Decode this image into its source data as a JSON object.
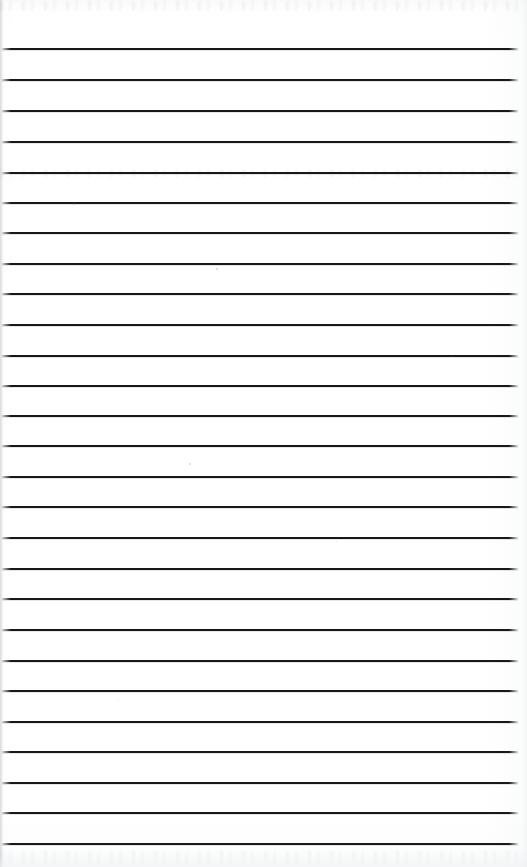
{
  "document": {
    "type": "scanned-lined-paper",
    "title": "Blank ruled page",
    "page_width": 527,
    "page_height": 867,
    "visible_text": "",
    "notes": "Scanned blank lined notebook / ledger sheet. No printed or handwritten text is legible; only horizontal ruled lines and faint scanner bleed-through artifacts are present."
  },
  "colors": {
    "paper": "#ffffff",
    "paper_tint": "#fbfbfc",
    "rule_line": "#17181b",
    "edge_shadow": "#e4e6e8",
    "ghost_artifact": "#282c34"
  },
  "ruling": {
    "line_count": 27,
    "line_thickness_px": 2,
    "first_line_y": 48,
    "last_line_y": 843,
    "average_spacing_px": 30.6,
    "left_margin_px": 2,
    "right_margin_px": 9,
    "line_left_x": 2,
    "line_width_px": 516,
    "lines_y": [
      48,
      79,
      110,
      141,
      172,
      202,
      232,
      263,
      293,
      324,
      355,
      385,
      415,
      445,
      476,
      506,
      537,
      568,
      598,
      629,
      660,
      690,
      721,
      751,
      782,
      812,
      843
    ]
  },
  "artifacts": {
    "ghost_bands": [
      {
        "name": "top-bleed-through",
        "y": 1,
        "height": 10
      },
      {
        "name": "mid-bleed-through",
        "y": 169,
        "height": 8
      },
      {
        "name": "footer-bleed-through",
        "y": 851,
        "height": 12
      }
    ],
    "specks": [
      {
        "x": 73,
        "y": 203,
        "size": 2
      },
      {
        "x": 216,
        "y": 268,
        "size": 2
      },
      {
        "x": 189,
        "y": 463,
        "size": 2
      },
      {
        "x": 336,
        "y": 541,
        "size": 1
      },
      {
        "x": 452,
        "y": 356,
        "size": 1
      },
      {
        "x": 118,
        "y": 700,
        "size": 1
      }
    ]
  }
}
